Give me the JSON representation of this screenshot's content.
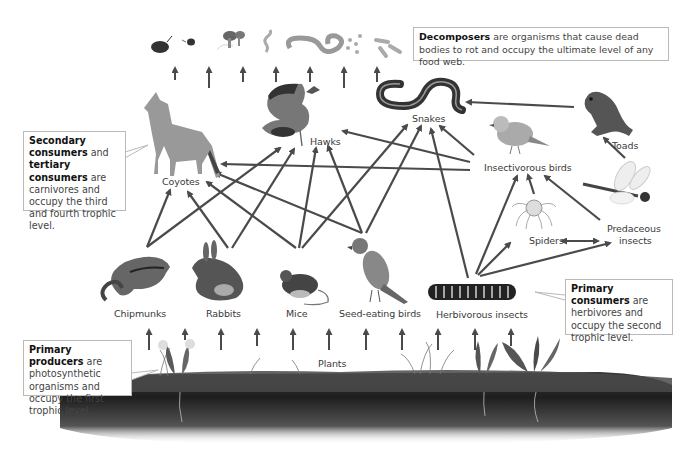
{
  "diagram": {
    "type": "food-web",
    "arrow_color": "#4a4a4a"
  },
  "decomposers": {
    "items": [
      "pill-bug",
      "beetle",
      "fungi",
      "worm-small",
      "earthworm",
      "bacteria-round",
      "bacteria-rod"
    ]
  },
  "callouts": {
    "decomposers": {
      "title": "Decomposers",
      "body": " are organisms that cause dead bodies to rot and occupy the ultimate level of any food web."
    },
    "secondary": {
      "title1": "Secondary consumers",
      "mid": " and ",
      "title2": "tertiary consumers",
      "body": " are carnivores and occupy the third and fourth trophic level."
    },
    "primary_consumers": {
      "title": "Primary consumers",
      "body": " are herbivores and occupy the second trophic level."
    },
    "primary_producers": {
      "title": "Primary producers",
      "body": " are photosynthetic organisms and occupy the first trophic level."
    }
  },
  "organisms": {
    "coyotes": "Coyotes",
    "hawks": "Hawks",
    "snakes": "Snakes",
    "toads": "Toads",
    "insectivorous_birds": "Insectivorous birds",
    "spiders": "Spiders",
    "predaceous_insects_1": "Predaceous",
    "predaceous_insects_2": "insects",
    "chipmunks": "Chipmunks",
    "rabbits": "Rabbits",
    "mice": "Mice",
    "seed_eating_birds": "Seed-eating birds",
    "herbivorous_insects": "Herbivorous insects",
    "plants": "Plants"
  },
  "links": [
    {
      "from": "Chipmunks",
      "to": "Coyotes"
    },
    {
      "from": "Chipmunks",
      "to": "Hawks"
    },
    {
      "from": "Rabbits",
      "to": "Coyotes"
    },
    {
      "from": "Rabbits",
      "to": "Hawks"
    },
    {
      "from": "Mice",
      "to": "Coyotes"
    },
    {
      "from": "Mice",
      "to": "Hawks"
    },
    {
      "from": "Mice",
      "to": "Snakes"
    },
    {
      "from": "Seed-eating birds",
      "to": "Coyotes"
    },
    {
      "from": "Seed-eating birds",
      "to": "Hawks"
    },
    {
      "from": "Seed-eating birds",
      "to": "Snakes"
    },
    {
      "from": "Herbivorous insects",
      "to": "Snakes"
    },
    {
      "from": "Herbivorous insects",
      "to": "Insectivorous birds"
    },
    {
      "from": "Herbivorous insects",
      "to": "Spiders"
    },
    {
      "from": "Herbivorous insects",
      "to": "Predaceous insects"
    },
    {
      "from": "Insectivorous birds",
      "to": "Coyotes"
    },
    {
      "from": "Insectivorous birds",
      "to": "Hawks"
    },
    {
      "from": "Insectivorous birds",
      "to": "Snakes"
    },
    {
      "from": "Spiders",
      "to": "Insectivorous birds"
    },
    {
      "from": "Predaceous insects",
      "to": "Insectivorous birds"
    },
    {
      "from": "Predaceous insects",
      "to": "Toads"
    },
    {
      "from": "Spiders",
      "to": "Predaceous insects",
      "bidirectional": true
    },
    {
      "from": "Toads",
      "to": "Snakes"
    },
    {
      "from": "Plants",
      "to": "Primary consumers"
    },
    {
      "from": "All organisms",
      "to": "Decomposers"
    }
  ]
}
